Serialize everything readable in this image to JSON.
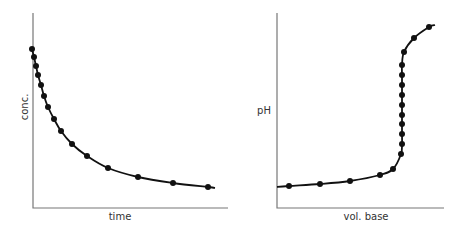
{
  "chart_data": [
    {
      "type": "scatter",
      "title": "",
      "xlabel": "time",
      "ylabel": "conc.",
      "grid": false,
      "ticks": false,
      "description": "Exponential decay of concentration over time",
      "curve": "smooth line through points",
      "points_px": [
        [
          32,
          49
        ],
        [
          34,
          57
        ],
        [
          36,
          66
        ],
        [
          38,
          75
        ],
        [
          41,
          85
        ],
        [
          44,
          96
        ],
        [
          48,
          107
        ],
        [
          54,
          119
        ],
        [
          61,
          131
        ],
        [
          72,
          144
        ],
        [
          87,
          156
        ],
        [
          108,
          168
        ],
        [
          138,
          177
        ],
        [
          173,
          183
        ],
        [
          208,
          187
        ]
      ],
      "line_end_px": [
        215,
        188
      ],
      "axes_px": {
        "origin": [
          33,
          208
        ],
        "y_top": 13,
        "x_right": 228
      },
      "x": [
        0,
        0.12,
        0.24,
        0.37,
        0.53,
        0.69,
        0.89,
        1.2,
        1.55,
        2.1,
        2.85,
        3.9,
        5.4,
        7.15,
        8.9
      ],
      "y": [
        100,
        95,
        89,
        83,
        77,
        70,
        63,
        55,
        48,
        39,
        31,
        24,
        18,
        14,
        11
      ],
      "xlim": [
        0,
        10
      ],
      "ylim": [
        0,
        125
      ]
    },
    {
      "type": "scatter",
      "title": "",
      "xlabel": "vol. base",
      "ylabel": "pH",
      "grid": false,
      "ticks": false,
      "description": "Acid-base titration curve with steep rise at equivalence point",
      "curve": "smooth line through points",
      "points_px": [
        [
          289,
          186
        ],
        [
          320,
          184
        ],
        [
          350,
          181
        ],
        [
          380,
          175
        ],
        [
          393,
          169
        ],
        [
          401,
          154
        ],
        [
          402,
          144
        ],
        [
          402,
          134
        ],
        [
          402,
          124
        ],
        [
          402,
          115
        ],
        [
          402,
          105
        ],
        [
          402,
          95
        ],
        [
          402,
          85
        ],
        [
          402,
          75
        ],
        [
          402,
          65
        ],
        [
          404,
          52
        ],
        [
          414,
          38
        ],
        [
          429,
          27
        ]
      ],
      "line_start_px": [
        277,
        187
      ],
      "line_end_px": [
        435,
        25
      ],
      "axes_px": {
        "origin": [
          277,
          208
        ],
        "y_top": 13,
        "x_right": 444
      },
      "x": [
        0.7,
        2.6,
        4.4,
        6.2,
        7.0,
        7.5,
        7.55,
        7.55,
        7.55,
        7.55,
        7.55,
        7.55,
        7.55,
        7.55,
        7.55,
        7.7,
        8.3,
        9.2
      ],
      "y": [
        11,
        12,
        14,
        17,
        20,
        28,
        33,
        38,
        44,
        48,
        54,
        59,
        64,
        69,
        74,
        81,
        88,
        94
      ],
      "xlim": [
        0,
        10
      ],
      "ylim": [
        0,
        100
      ]
    }
  ],
  "left_chart": {
    "xlabel": "time",
    "ylabel": "conc."
  },
  "right_chart": {
    "xlabel": "vol. base",
    "ylabel": "pH"
  }
}
